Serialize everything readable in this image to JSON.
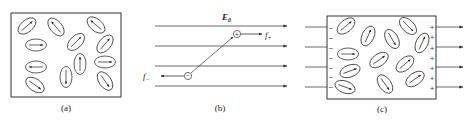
{
  "figure": {
    "panels": [
      {
        "id": "a",
        "label": "(a)",
        "description": "Randomly oriented polar molecules (dipoles) with no applied field",
        "box": {
          "x": 11,
          "y": 13,
          "w": 110,
          "h": 84
        },
        "dipoles": [
          {
            "cx": 27,
            "cy": 26,
            "angle": -40
          },
          {
            "cx": 56,
            "cy": 27,
            "angle": 230
          },
          {
            "cx": 96,
            "cy": 25,
            "angle": 220
          },
          {
            "cx": 36,
            "cy": 45,
            "angle": 0
          },
          {
            "cx": 76,
            "cy": 42,
            "angle": -45
          },
          {
            "cx": 105,
            "cy": 44,
            "angle": -50
          },
          {
            "cx": 36,
            "cy": 67,
            "angle": 180
          },
          {
            "cx": 80,
            "cy": 64,
            "angle": -90
          },
          {
            "cx": 105,
            "cy": 62,
            "angle": 0
          },
          {
            "cx": 66,
            "cy": 77,
            "angle": 90
          },
          {
            "cx": 35,
            "cy": 85,
            "angle": 35
          },
          {
            "cx": 105,
            "cy": 81,
            "angle": 55
          }
        ]
      },
      {
        "id": "b",
        "label": "(b)",
        "description": "A single dipole in a uniform external field E0 experiencing forces f+ and f-",
        "field_label": "E",
        "field_subscript": "0",
        "field_lines_y": [
          26,
          46,
          66,
          86
        ],
        "field_lines_x": [
          155,
          287
        ],
        "positive_charge": {
          "cx": 237,
          "cy": 34,
          "symbol": "+"
        },
        "negative_charge": {
          "cx": 188,
          "cy": 76,
          "symbol": "−"
        },
        "force_plus_label": "f",
        "force_plus_sub": "+",
        "force_minus_label": "f",
        "force_minus_sub": "−"
      },
      {
        "id": "c",
        "label": "(c)",
        "description": "Dielectric in external field: dipoles partially aligned, bound surface charges appear",
        "box": {
          "x": 327,
          "y": 16,
          "w": 109,
          "h": 83
        },
        "field_lines_y": [
          27,
          47,
          67,
          87
        ],
        "left_arrow_x": [
          305,
          327
        ],
        "right_arrow_x": [
          436,
          463
        ],
        "surface_charges_left": {
          "symbol": "−",
          "ys": [
            28,
            38,
            48,
            58,
            68,
            77,
            87
          ]
        },
        "surface_charges_right": {
          "symbol": "+",
          "ys": [
            27,
            37,
            48,
            58,
            68,
            78,
            88
          ]
        },
        "dipoles": [
          {
            "cx": 346,
            "cy": 26,
            "angle": -40
          },
          {
            "cx": 368,
            "cy": 36,
            "angle": -65
          },
          {
            "cx": 392,
            "cy": 39,
            "angle": 60
          },
          {
            "cx": 408,
            "cy": 26,
            "angle": 45
          },
          {
            "cx": 422,
            "cy": 43,
            "angle": -65
          },
          {
            "cx": 348,
            "cy": 54,
            "angle": 0
          },
          {
            "cx": 379,
            "cy": 60,
            "angle": -35
          },
          {
            "cx": 405,
            "cy": 64,
            "angle": -40
          },
          {
            "cx": 350,
            "cy": 71,
            "angle": -20
          },
          {
            "cx": 385,
            "cy": 84,
            "angle": 55
          },
          {
            "cx": 415,
            "cy": 79,
            "angle": -35
          },
          {
            "cx": 345,
            "cy": 87,
            "angle": 20
          }
        ]
      }
    ],
    "colors": {
      "stroke": "#333333",
      "line": "#444444",
      "background": "#ffffff"
    }
  }
}
